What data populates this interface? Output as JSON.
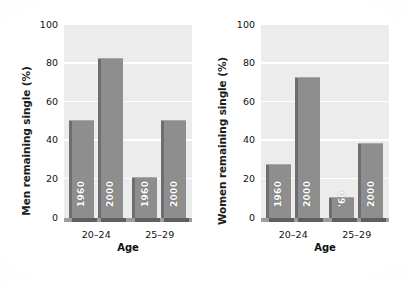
{
  "chart_data": [
    {
      "type": "bar",
      "title": "",
      "panel_name": "men",
      "xlabel": "Age",
      "ylabel": "Men remaining single (%)",
      "categories": [
        "20–24",
        "25–29"
      ],
      "series": [
        {
          "name": "1960",
          "values": [
            51,
            21
          ]
        },
        {
          "name": "2000",
          "values": [
            83,
            51
          ]
        }
      ],
      "bars": [
        {
          "group": "20–24",
          "series": "1960",
          "label": "1960",
          "value": 51
        },
        {
          "group": "20–24",
          "series": "2000",
          "label": "2000",
          "value": 83
        },
        {
          "group": "25–29",
          "series": "1960",
          "label": "1960",
          "value": 21
        },
        {
          "group": "25–29",
          "series": "2000",
          "label": "2000",
          "value": 51
        }
      ],
      "ylim": [
        0,
        100
      ],
      "yticks": [
        0,
        20,
        40,
        60,
        80,
        100
      ],
      "grid": true,
      "legend": "none"
    },
    {
      "type": "bar",
      "title": "",
      "panel_name": "women",
      "xlabel": "Age",
      "ylabel": "Women remaining single (%)",
      "categories": [
        "20–24",
        "25–29"
      ],
      "series": [
        {
          "name": "1960",
          "values": [
            28,
            11
          ]
        },
        {
          "name": "2000",
          "values": [
            73,
            39
          ]
        }
      ],
      "bars": [
        {
          "group": "20–24",
          "series": "1960",
          "label": "1960",
          "value": 28
        },
        {
          "group": "20–24",
          "series": "2000",
          "label": "2000",
          "value": 73
        },
        {
          "group": "25–29",
          "series": "1960",
          "label": "'60",
          "value": 11
        },
        {
          "group": "25–29",
          "series": "2000",
          "label": "2000",
          "value": 39
        }
      ],
      "ylim": [
        0,
        100
      ],
      "yticks": [
        0,
        20,
        40,
        60,
        80,
        100
      ],
      "grid": true,
      "legend": "none"
    }
  ],
  "colors": {
    "bar_fill": "#8e8e8e",
    "bar_shadow": "#5f5f5f",
    "bar_edge": "#6e6e6e",
    "plot_background": "#ececed",
    "gridline": "#ffffff",
    "figure_background": "#ffffff",
    "text": "#111111",
    "bar_label_text": "#ffffff"
  }
}
